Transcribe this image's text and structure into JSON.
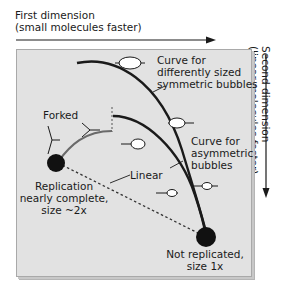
{
  "axes": {
    "first_dimension": {
      "title": "First dimension",
      "subtitle": "(small molecules faster)"
    },
    "second_dimension": {
      "title": "Second dimension",
      "subtitle": "(linear molecules faster)"
    }
  },
  "labels": {
    "symmetric_curve": [
      "Curve for",
      "differently sized",
      "symmetric bubbles"
    ],
    "asymmetric_curve": [
      "Curve for",
      "asymmetric",
      "bubbles"
    ],
    "forked": "Forked",
    "linear": "Linear",
    "replication_complete": [
      "Replication",
      "nearly complete,",
      "size ~2x"
    ],
    "not_replicated": [
      "Not replicated,",
      "size 1x"
    ]
  },
  "colors": {
    "panel_background": "#e2e2e2",
    "panel_border": "#a9a9a9",
    "curve": "#1a1a1a",
    "forked_curve": "#666666",
    "spot": "#111111",
    "bubble_fill": "#ffffff"
  }
}
